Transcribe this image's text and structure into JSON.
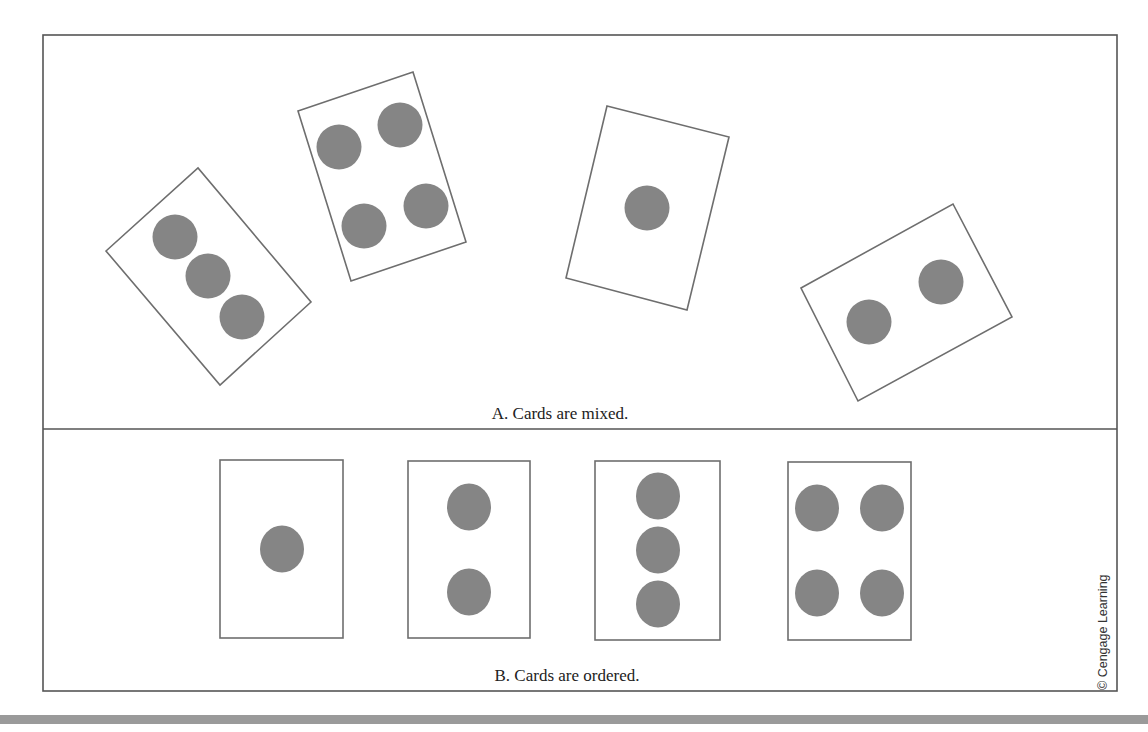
{
  "panel_a": {
    "caption": "A. Cards are mixed.",
    "cards": [
      {
        "dots": 3,
        "corners": [
          [
            106,
            251
          ],
          [
            198,
            168
          ],
          [
            311,
            302
          ],
          [
            220,
            385
          ]
        ],
        "dot_positions": [
          [
            175,
            237
          ],
          [
            208,
            276
          ],
          [
            242,
            317
          ]
        ]
      },
      {
        "dots": 4,
        "corners": [
          [
            298,
            111
          ],
          [
            413,
            72
          ],
          [
            466,
            242
          ],
          [
            351,
            281
          ]
        ],
        "dot_positions": [
          [
            339,
            147
          ],
          [
            400,
            125
          ],
          [
            364,
            226
          ],
          [
            426,
            206
          ]
        ]
      },
      {
        "dots": 1,
        "corners": [
          [
            607,
            106
          ],
          [
            729,
            137
          ],
          [
            687,
            310
          ],
          [
            566,
            278
          ]
        ],
        "dot_positions": [
          [
            647,
            208
          ]
        ]
      },
      {
        "dots": 2,
        "corners": [
          [
            801,
            288
          ],
          [
            953,
            204
          ],
          [
            1012,
            317
          ],
          [
            858,
            401
          ]
        ],
        "dot_positions": [
          [
            869,
            322
          ],
          [
            941,
            282
          ]
        ]
      }
    ]
  },
  "panel_b": {
    "caption": "B. Cards are ordered.",
    "cards": [
      {
        "dots": 1,
        "box": [
          220,
          460,
          123,
          178
        ],
        "dot_positions": [
          [
            282,
            549
          ]
        ]
      },
      {
        "dots": 2,
        "box": [
          408,
          461,
          122,
          177
        ],
        "dot_positions": [
          [
            469,
            507
          ],
          [
            469,
            592
          ]
        ]
      },
      {
        "dots": 3,
        "box": [
          595,
          461,
          125,
          179
        ],
        "dot_positions": [
          [
            658,
            496
          ],
          [
            658,
            550
          ],
          [
            658,
            604
          ]
        ]
      },
      {
        "dots": 4,
        "box": [
          788,
          462,
          123,
          178
        ],
        "dot_positions": [
          [
            817,
            508
          ],
          [
            882,
            508
          ],
          [
            817,
            593
          ],
          [
            882,
            593
          ]
        ]
      }
    ]
  },
  "credit": "© Cengage Learning",
  "colors": {
    "dot": "#858585",
    "card_stroke": "#6e6e6e",
    "frame_stroke": "#555555",
    "bottom_bar": "#9a9a9a"
  }
}
